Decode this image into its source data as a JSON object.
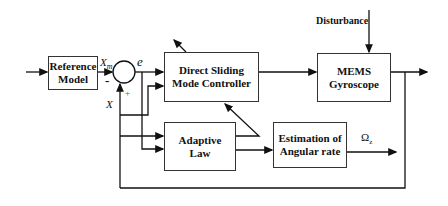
{
  "diagram": {
    "blocks": {
      "reference_model": {
        "line1": "Reference",
        "line2": "Model"
      },
      "controller": {
        "line1": "Direct Sliding",
        "line2": "Mode Controller"
      },
      "gyroscope": {
        "line1": "MEMS",
        "line2": "Gyroscope"
      },
      "adaptive_law": {
        "line1": "Adaptive",
        "line2": "Law"
      },
      "estimation": {
        "line1": "Estimation of",
        "line2": "Angular rate"
      }
    },
    "labels": {
      "xm": "X",
      "xm_sub": "m",
      "minus": "-",
      "plus": "+",
      "e": "e",
      "x": "X",
      "disturbance": "Disturbance",
      "omega": "Ω",
      "omega_sub": "z"
    }
  }
}
